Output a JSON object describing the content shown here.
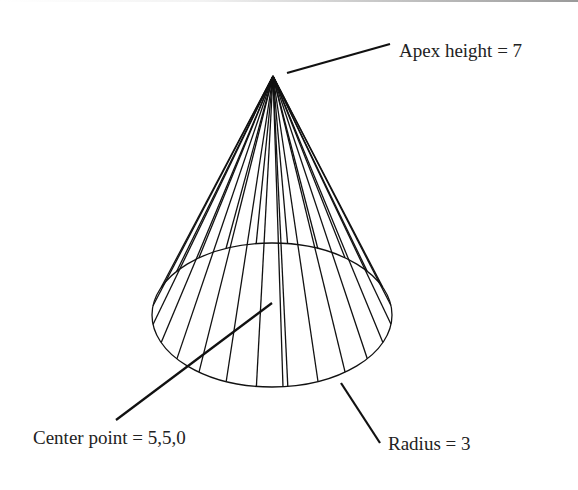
{
  "diagram": {
    "labels": {
      "apex": "Apex height = 7",
      "center": "Center point = 5,5,0",
      "radius": "Radius = 3"
    },
    "cone": {
      "apex": [
        273,
        76
      ],
      "base_center": [
        272,
        315
      ],
      "rx": 120,
      "ry": 72,
      "generators": 24
    },
    "leaders": {
      "apex": [
        [
          287,
          73
        ],
        [
          390,
          44
        ]
      ],
      "center": [
        [
          272,
          303
        ],
        [
          116,
          420
        ]
      ],
      "radius": [
        [
          341,
          383
        ],
        [
          380,
          443
        ]
      ]
    },
    "label_positions": {
      "apex": [
        399,
        57
      ],
      "center": [
        33,
        444
      ],
      "radius": [
        388,
        450
      ]
    },
    "colors": {
      "line": "#111111",
      "text": "#222222",
      "background": "#ffffff"
    }
  }
}
